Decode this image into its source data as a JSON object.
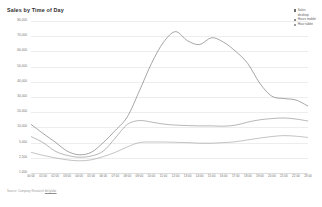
{
  "chart_data": {
    "type": "line",
    "title": "Sales by Time of Day",
    "xlabel": "",
    "ylabel": "",
    "grid": true,
    "legend_position": "top-right",
    "ylim": [
      0,
      80000
    ],
    "yticks": [
      80000,
      70000,
      60000,
      50000,
      40000,
      30000,
      20000,
      10000,
      5000,
      2500,
      1000
    ],
    "ytick_labels": [
      "80,000",
      "70,000",
      "60,000",
      "50,000",
      "40,000",
      "30,000",
      "20,000",
      "10,000",
      "5,000",
      "2,500",
      "1,000"
    ],
    "categories": [
      "00:00",
      "01:00",
      "02:00",
      "03:00",
      "04:00",
      "05:00",
      "06:00",
      "07:00",
      "08:00",
      "09:00",
      "10:00",
      "11:00",
      "12:00",
      "13:00",
      "14:00",
      "15:00",
      "16:00",
      "17:00",
      "18:00",
      "19:00",
      "20:00",
      "21:00",
      "22:00",
      "23:00"
    ],
    "series": [
      {
        "name": "Sales",
        "color": "#6f6f6f",
        "values": [
          12000,
          8000,
          5200,
          3600,
          3000,
          3400,
          5000,
          9000,
          17000,
          34000,
          52000,
          66000,
          73000,
          67000,
          64500,
          69000,
          66000,
          60000,
          52000,
          39000,
          30500,
          29000,
          28000,
          24000
        ]
      },
      {
        "name": "Hours mobile",
        "color": "#8a8a8a",
        "values": [
          7000,
          5000,
          3600,
          2900,
          2600,
          2800,
          3600,
          6500,
          12000,
          14500,
          13500,
          12200,
          11500,
          11200,
          11000,
          11000,
          10800,
          11500,
          13500,
          15000,
          15800,
          16200,
          15500,
          14200
        ]
      },
      {
        "name": "Hour tablet",
        "color": "#9d9d9d",
        "values": [
          3400,
          2900,
          2500,
          2300,
          2200,
          2300,
          2700,
          3400,
          4300,
          5000,
          5200,
          5200,
          5100,
          5000,
          4900,
          4900,
          5000,
          5300,
          5900,
          6500,
          7000,
          7300,
          7100,
          6700
        ]
      }
    ]
  },
  "legend": {
    "items": [
      {
        "label": "Sales",
        "sublabel": "desktop",
        "color": "#6f6f6f"
      },
      {
        "label": "Hours mobile",
        "color": "#8a8a8a"
      },
      {
        "label": "Hour tablet",
        "color": "#9d9d9d"
      }
    ]
  },
  "footer": {
    "text": "Source: Company Research ",
    "link_text": "bit.ly/abc"
  }
}
